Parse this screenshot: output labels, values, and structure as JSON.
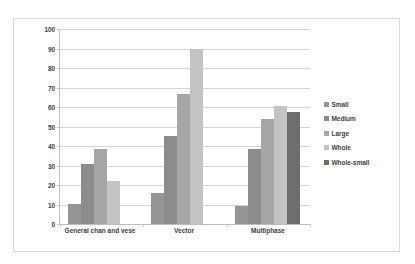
{
  "chart_data": {
    "type": "bar",
    "title": "",
    "xlabel": "",
    "ylabel": "",
    "ylim": [
      0,
      100
    ],
    "ytick_step": 10,
    "yticks": [
      "100",
      "90",
      "80",
      "70",
      "60",
      "50",
      "40",
      "30",
      "20",
      "10",
      "0"
    ],
    "grid": true,
    "legend_position": "right",
    "categories": [
      "General chan and vese",
      "Vector",
      "Multiphase"
    ],
    "series": [
      {
        "name": "Small",
        "color": "#969696",
        "values": [
          10.5,
          16,
          9
        ]
      },
      {
        "name": "Medium",
        "color": "#8c8c8c",
        "values": [
          31,
          45,
          38.5
        ]
      },
      {
        "name": "Large",
        "color": "#a6a6a6",
        "values": [
          38.5,
          66.5,
          54
        ]
      },
      {
        "name": "Whole",
        "color": "#c4c4c4",
        "values": [
          22,
          90,
          60.5
        ]
      },
      {
        "name": "Whole-small",
        "color": "#6e6e6e",
        "values": [
          null,
          null,
          57.5
        ]
      }
    ]
  }
}
